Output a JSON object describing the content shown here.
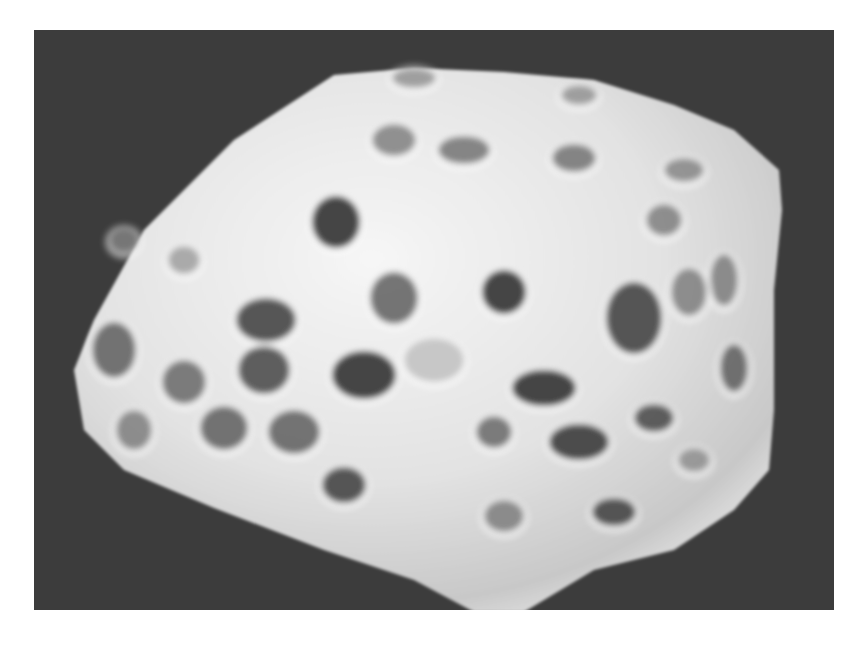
{
  "image": {
    "subject": "porous particle micrograph",
    "background_color": "#3c3c3c",
    "page_color": "#ffffff",
    "particle_color_light": "#f4f4f4",
    "particle_color_mid": "#cfcfcf",
    "pore_color": "#3a3a3a",
    "frame": {
      "x": 34,
      "y": 30,
      "width": 800,
      "height": 580
    }
  },
  "particle_outline": "40,340 60,290 110,200 200,110 300,45 380,38 470,42 560,50 640,75 700,100 745,140 748,180 740,260 740,380 735,440 700,480 640,520 560,540 490,582 440,582 380,550 290,520 180,478 90,440 50,400",
  "pores": [
    {
      "cx": 302,
      "cy": 192,
      "rx": 24,
      "ry": 26,
      "o": 0.95
    },
    {
      "cx": 470,
      "cy": 262,
      "rx": 22,
      "ry": 22,
      "o": 0.95
    },
    {
      "cx": 360,
      "cy": 268,
      "rx": 24,
      "ry": 26,
      "o": 0.7
    },
    {
      "cx": 600,
      "cy": 288,
      "rx": 28,
      "ry": 36,
      "o": 0.85
    },
    {
      "cx": 330,
      "cy": 345,
      "rx": 32,
      "ry": 24,
      "o": 0.95
    },
    {
      "cx": 232,
      "cy": 290,
      "rx": 30,
      "ry": 22,
      "o": 0.85
    },
    {
      "cx": 230,
      "cy": 340,
      "rx": 26,
      "ry": 24,
      "o": 0.8
    },
    {
      "cx": 510,
      "cy": 358,
      "rx": 32,
      "ry": 18,
      "o": 0.95
    },
    {
      "cx": 545,
      "cy": 412,
      "rx": 30,
      "ry": 18,
      "o": 0.9
    },
    {
      "cx": 80,
      "cy": 320,
      "rx": 22,
      "ry": 28,
      "o": 0.7
    },
    {
      "cx": 150,
      "cy": 352,
      "rx": 22,
      "ry": 22,
      "o": 0.65
    },
    {
      "cx": 100,
      "cy": 400,
      "rx": 18,
      "ry": 20,
      "o": 0.55
    },
    {
      "cx": 190,
      "cy": 398,
      "rx": 24,
      "ry": 22,
      "o": 0.7
    },
    {
      "cx": 260,
      "cy": 402,
      "rx": 26,
      "ry": 22,
      "o": 0.7
    },
    {
      "cx": 310,
      "cy": 455,
      "rx": 22,
      "ry": 18,
      "o": 0.85
    },
    {
      "cx": 460,
      "cy": 402,
      "rx": 18,
      "ry": 16,
      "o": 0.65
    },
    {
      "cx": 470,
      "cy": 486,
      "rx": 20,
      "ry": 16,
      "o": 0.55
    },
    {
      "cx": 580,
      "cy": 482,
      "rx": 22,
      "ry": 14,
      "o": 0.85
    },
    {
      "cx": 620,
      "cy": 388,
      "rx": 20,
      "ry": 14,
      "o": 0.8
    },
    {
      "cx": 700,
      "cy": 338,
      "rx": 14,
      "ry": 24,
      "o": 0.7
    },
    {
      "cx": 690,
      "cy": 250,
      "rx": 14,
      "ry": 26,
      "o": 0.55
    },
    {
      "cx": 655,
      "cy": 262,
      "rx": 18,
      "ry": 24,
      "o": 0.55
    },
    {
      "cx": 630,
      "cy": 190,
      "rx": 18,
      "ry": 16,
      "o": 0.55
    },
    {
      "cx": 650,
      "cy": 140,
      "rx": 20,
      "ry": 12,
      "o": 0.5
    },
    {
      "cx": 540,
      "cy": 128,
      "rx": 22,
      "ry": 14,
      "o": 0.6
    },
    {
      "cx": 430,
      "cy": 120,
      "rx": 26,
      "ry": 14,
      "o": 0.6
    },
    {
      "cx": 360,
      "cy": 110,
      "rx": 22,
      "ry": 16,
      "o": 0.55
    },
    {
      "cx": 380,
      "cy": 48,
      "rx": 22,
      "ry": 10,
      "o": 0.45
    },
    {
      "cx": 545,
      "cy": 65,
      "rx": 18,
      "ry": 10,
      "o": 0.45
    },
    {
      "cx": 90,
      "cy": 210,
      "rx": 14,
      "ry": 12,
      "o": 0.4
    },
    {
      "cx": 150,
      "cy": 230,
      "rx": 16,
      "ry": 14,
      "o": 0.4
    },
    {
      "cx": 660,
      "cy": 430,
      "rx": 16,
      "ry": 12,
      "o": 0.45
    },
    {
      "cx": 400,
      "cy": 330,
      "rx": 30,
      "ry": 22,
      "o": 0.25
    }
  ]
}
